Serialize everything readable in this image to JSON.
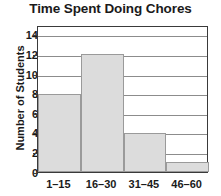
{
  "chart_data": {
    "type": "bar",
    "title": "Time Spent Doing Chores",
    "xlabel": "",
    "ylabel": "Number of Students",
    "categories": [
      "1–15",
      "16–30",
      "31–45",
      "46–60"
    ],
    "values": [
      8,
      12,
      4,
      1
    ],
    "ylim": [
      0,
      15
    ],
    "yticks": [
      0,
      2,
      4,
      6,
      8,
      10,
      12,
      14
    ],
    "ytick_labels": [
      "0",
      "2",
      "4",
      "6",
      "8",
      "10",
      "12",
      "14"
    ],
    "grid": true,
    "grid_axis": "y",
    "legend": false,
    "bar_fill_color": "#dcdcdc",
    "bar_border_color": "#9a9a9a",
    "axis_color": "#3a3a3a",
    "gridline_color": "#8c8c8c",
    "text_color": "#1a1a1a",
    "series": [
      {
        "name": "Number of Students",
        "values": [
          8,
          12,
          4,
          1
        ]
      }
    ]
  }
}
